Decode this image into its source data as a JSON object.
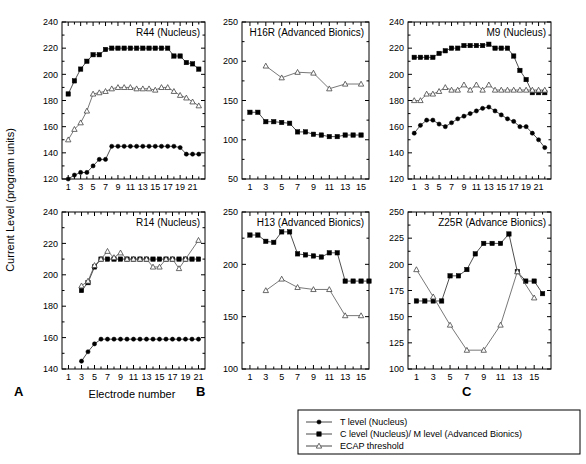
{
  "figure": {
    "y_axis_title": "Current Level (program units)",
    "x_axis_title": "Electrode number",
    "panel_letters": [
      "A",
      "B",
      "C"
    ]
  },
  "legend": {
    "position": "bottom-right",
    "entries": [
      {
        "label": "T level (Nucleus)",
        "marker": "filled-circle"
      },
      {
        "label": "C level (Nucleus)/ M level (Advanced Bionics)",
        "marker": "filled-square"
      },
      {
        "label": "ECAP threshold",
        "marker": "open-triangle"
      }
    ]
  },
  "chart_data": [
    {
      "id": "r44",
      "type": "line",
      "title": "R44 (Nucleus)",
      "xlabel": "Electrode number",
      "ylabel": "Current Level (program units)",
      "xlim": [
        0,
        23
      ],
      "ylim": [
        120,
        240
      ],
      "yticks": [
        120,
        140,
        160,
        180,
        200,
        220,
        240
      ],
      "xticks": [
        1,
        3,
        5,
        7,
        9,
        11,
        13,
        15,
        17,
        19,
        21
      ],
      "x": [
        1,
        2,
        3,
        4,
        5,
        6,
        7,
        8,
        9,
        10,
        11,
        12,
        13,
        14,
        15,
        16,
        17,
        18,
        19,
        20,
        21,
        22
      ],
      "series": [
        {
          "name": "C level (Nucleus)/ M level (Advanced Bionics)",
          "marker": "filled-square",
          "values": [
            185,
            195,
            204,
            210,
            215,
            215,
            219,
            220,
            220,
            220,
            220,
            220,
            220,
            220,
            220,
            220,
            220,
            214,
            214,
            209,
            208,
            204
          ]
        },
        {
          "name": "ECAP threshold",
          "marker": "open-triangle",
          "values": [
            150,
            158,
            163,
            172,
            185,
            186,
            187,
            189,
            190,
            190,
            190,
            189,
            189,
            189,
            188,
            190,
            190,
            187,
            184,
            182,
            179,
            176
          ]
        },
        {
          "name": "T level (Nucleus)",
          "marker": "filled-circle",
          "values": [
            120,
            123,
            125,
            125,
            130,
            135,
            135,
            145,
            145,
            145,
            145,
            145,
            145,
            145,
            145,
            145,
            145,
            145,
            144,
            139,
            139,
            139
          ]
        }
      ]
    },
    {
      "id": "h16r",
      "type": "line",
      "title": "H16R (Advanced Bionics)",
      "xlim": [
        0,
        16
      ],
      "ylim": [
        50,
        250
      ],
      "yticks": [
        50,
        100,
        150,
        200,
        250
      ],
      "xticks": [
        1,
        3,
        5,
        7,
        9,
        11,
        13,
        15
      ],
      "x": [
        1,
        2,
        3,
        4,
        5,
        6,
        7,
        8,
        9,
        10,
        11,
        12,
        13,
        14,
        15
      ],
      "series": [
        {
          "name": "ECAP threshold",
          "marker": "open-triangle",
          "values": [
            null,
            null,
            194,
            null,
            179,
            null,
            186,
            null,
            185,
            null,
            165,
            null,
            171,
            null,
            171
          ]
        },
        {
          "name": "C level (Nucleus)/ M level (Advanced Bionics)",
          "marker": "filled-square",
          "values": [
            135,
            135,
            123,
            123,
            122,
            121,
            110,
            110,
            107,
            106,
            104,
            104,
            106,
            106,
            106
          ]
        }
      ]
    },
    {
      "id": "m9",
      "type": "line",
      "title": "M9 (Nucleus)",
      "xlim": [
        0,
        23
      ],
      "ylim": [
        120,
        240
      ],
      "yticks": [
        120,
        140,
        160,
        180,
        200,
        220,
        240
      ],
      "xticks": [
        1,
        3,
        5,
        7,
        9,
        11,
        13,
        15,
        17,
        19,
        21
      ],
      "x": [
        1,
        2,
        3,
        4,
        5,
        6,
        7,
        8,
        9,
        10,
        11,
        12,
        13,
        14,
        15,
        16,
        17,
        18,
        19,
        20,
        21,
        22
      ],
      "series": [
        {
          "name": "C level (Nucleus)/ M level (Advanced Bionics)",
          "marker": "filled-square",
          "values": [
            213,
            213,
            213,
            213,
            216,
            218,
            220,
            220,
            222,
            222,
            222,
            222,
            223,
            220,
            220,
            220,
            214,
            203,
            196,
            186,
            186,
            186
          ]
        },
        {
          "name": "ECAP threshold",
          "marker": "open-triangle",
          "values": [
            180,
            180,
            185,
            185,
            187,
            190,
            188,
            188,
            192,
            188,
            192,
            188,
            192,
            188,
            188,
            188,
            188,
            188,
            188,
            188,
            188,
            188
          ]
        },
        {
          "name": "T level (Nucleus)",
          "marker": "filled-circle",
          "values": [
            155,
            161,
            165,
            165,
            162,
            160,
            163,
            166,
            168,
            170,
            172,
            174,
            175,
            172,
            169,
            166,
            164,
            160,
            160,
            155,
            150,
            144
          ]
        }
      ]
    },
    {
      "id": "r14",
      "type": "line",
      "title": "R14 (Nucleus)",
      "xlim": [
        0,
        22
      ],
      "ylim": [
        140,
        240
      ],
      "yticks": [
        140,
        160,
        180,
        200,
        220,
        240
      ],
      "xticks": [
        1,
        3,
        5,
        7,
        9,
        11,
        13,
        15,
        17,
        19,
        21
      ],
      "x": [
        3,
        4,
        5,
        6,
        7,
        8,
        9,
        10,
        11,
        12,
        13,
        14,
        15,
        16,
        17,
        18,
        19,
        20,
        21
      ],
      "series": [
        {
          "name": "C level (Nucleus)/ M level (Advanced Bionics)",
          "marker": "filled-square",
          "values": [
            190,
            195,
            205,
            210,
            210,
            210,
            210,
            210,
            210,
            210,
            210,
            210,
            210,
            210,
            210,
            210,
            210,
            210,
            210
          ]
        },
        {
          "name": "ECAP threshold",
          "marker": "open-triangle",
          "values": [
            193,
            196,
            206,
            210,
            215,
            211,
            214,
            210,
            210,
            210,
            210,
            205,
            205,
            210,
            210,
            204,
            210,
            null,
            222
          ]
        },
        {
          "name": "T level (Nucleus)",
          "marker": "filled-circle",
          "values": [
            145,
            151,
            156,
            159,
            159,
            159,
            159,
            159,
            159,
            159,
            159,
            159,
            159,
            159,
            159,
            159,
            159,
            159,
            159
          ]
        }
      ]
    },
    {
      "id": "h13",
      "type": "line",
      "title": "H13 (Advanced Bionics)",
      "xlim": [
        0,
        16
      ],
      "ylim": [
        100,
        250
      ],
      "yticks": [
        100,
        150,
        200,
        250
      ],
      "xticks": [
        1,
        3,
        5,
        7,
        9,
        11,
        13,
        15
      ],
      "x": [
        1,
        2,
        3,
        4,
        5,
        6,
        7,
        8,
        9,
        10,
        11,
        12,
        13,
        14,
        15,
        16
      ],
      "series": [
        {
          "name": "C level (Nucleus)/ M level (Advanced Bionics)",
          "marker": "filled-square",
          "values": [
            228,
            228,
            222,
            221,
            231,
            231,
            210,
            209,
            208,
            207,
            211,
            211,
            184,
            184,
            184,
            184
          ]
        },
        {
          "name": "ECAP threshold",
          "marker": "open-triangle",
          "values": [
            null,
            null,
            175,
            null,
            186,
            null,
            178,
            null,
            176,
            null,
            176,
            null,
            151,
            null,
            151,
            null
          ]
        }
      ]
    },
    {
      "id": "z25r",
      "type": "line",
      "title": "Z25R (Advance Bionics)",
      "xlim": [
        0,
        17
      ],
      "ylim": [
        100,
        250
      ],
      "yticks": [
        100,
        125,
        150,
        175,
        200,
        225,
        250
      ],
      "xticks": [
        1,
        3,
        5,
        7,
        9,
        11,
        13,
        15
      ],
      "x": [
        1,
        2,
        3,
        4,
        5,
        6,
        7,
        8,
        9,
        10,
        11,
        12,
        13,
        14,
        15,
        16
      ],
      "series": [
        {
          "name": "C level (Nucleus)/ M level (Advanced Bionics)",
          "marker": "filled-square",
          "values": [
            165,
            165,
            165,
            165,
            189,
            189,
            195,
            210,
            220,
            220,
            220,
            229,
            193,
            184,
            184,
            172
          ]
        },
        {
          "name": "ECAP threshold",
          "marker": "open-triangle",
          "values": [
            195,
            null,
            169,
            null,
            142,
            null,
            118,
            null,
            118,
            null,
            142,
            null,
            193,
            null,
            168,
            null
          ]
        }
      ]
    }
  ]
}
